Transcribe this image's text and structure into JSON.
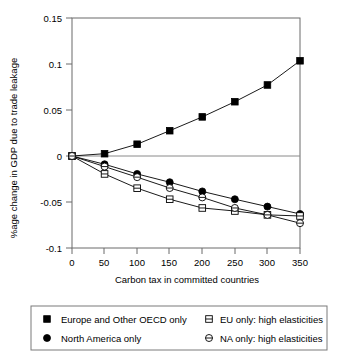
{
  "chart_data": {
    "type": "line",
    "title": "",
    "xlabel": "Carbon tax in committed countries",
    "ylabel": "%age change in GDP due to trade leakage",
    "x": [
      0,
      50,
      100,
      150,
      200,
      250,
      300,
      350
    ],
    "xlim": [
      0,
      370
    ],
    "ylim": [
      -0.1,
      0.15
    ],
    "xticks": [
      "0",
      "50",
      "100",
      "150",
      "200",
      "250",
      "300",
      "350"
    ],
    "yticks": [
      "0.15",
      "0.1",
      "0.05",
      "0",
      "-0.05",
      "-0.1"
    ],
    "ytick_values": [
      0.15,
      0.1,
      0.05,
      0,
      -0.05,
      -0.1
    ],
    "grid": false,
    "legend_position": "below",
    "series": [
      {
        "name": "Europe and Other OECD only",
        "marker": "filled-square",
        "values": [
          0,
          0.0025,
          0.0128,
          0.0275,
          0.0425,
          0.059,
          0.0772,
          0.1035
        ]
      },
      {
        "name": "North America only",
        "marker": "filled-circle",
        "values": [
          0,
          -0.009,
          -0.0195,
          -0.0285,
          -0.0385,
          -0.047,
          -0.055,
          -0.063
        ]
      },
      {
        "name": "EU only: high elasticities",
        "marker": "open-square-line",
        "values": [
          0,
          -0.0195,
          -0.035,
          -0.047,
          -0.0565,
          -0.0598,
          -0.064,
          -0.0652
        ]
      },
      {
        "name": "NA only: high elasticities",
        "marker": "open-circle-line",
        "values": [
          0,
          -0.0115,
          -0.023,
          -0.0348,
          -0.045,
          -0.0565,
          -0.064,
          -0.073
        ]
      }
    ]
  },
  "legend": {
    "items": [
      {
        "label": "Europe and Other OECD only",
        "marker": "filled-square"
      },
      {
        "label": "North America only",
        "marker": "filled-circle"
      },
      {
        "label": "EU only: high elasticities",
        "marker": "open-square-line"
      },
      {
        "label": "NA only: high elasticities",
        "marker": "open-circle-line"
      }
    ]
  },
  "colors": {
    "marker": "#000000",
    "line": "#000000",
    "axis": "#6b6b6b",
    "background": "#ffffff"
  }
}
